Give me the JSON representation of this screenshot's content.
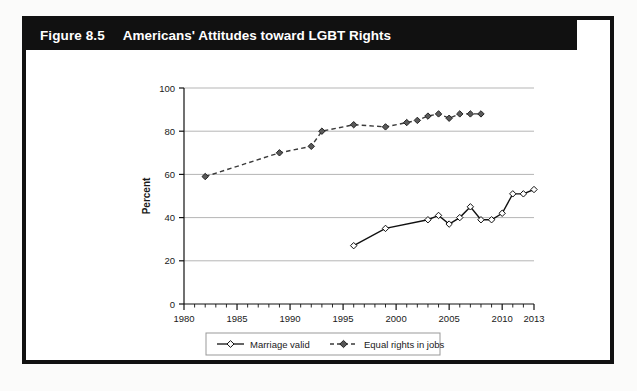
{
  "figure": {
    "number": "Figure 8.5",
    "title": "Americans' Attitudes toward LGBT Rights"
  },
  "chart_data": {
    "type": "line",
    "title": "Americans' Attitudes toward LGBT Rights",
    "xlabel": "Year",
    "ylabel": "Percent",
    "xlim": [
      1980,
      2013
    ],
    "ylim": [
      0,
      100
    ],
    "ytick_labels": [
      "0",
      "20",
      "40",
      "60",
      "80",
      "100"
    ],
    "yticks": [
      0,
      20,
      40,
      60,
      80,
      100
    ],
    "xtick_labels": [
      "1980",
      "1985",
      "1990",
      "1995",
      "2000",
      "2005",
      "2010",
      "2013"
    ],
    "xticks": [
      1980,
      1985,
      1990,
      1995,
      2000,
      2005,
      2010,
      2013
    ],
    "minor_xtick_step": 1,
    "grid": "horizontal",
    "legend_position": "bottom-center",
    "series": [
      {
        "name": "Marriage valid",
        "style": "solid",
        "marker": "open-diamond",
        "color": "#111111",
        "x": [
          1996,
          1999,
          2003,
          2004,
          2005,
          2006,
          2007,
          2008,
          2009,
          2010,
          2011,
          2012,
          2013
        ],
        "values": [
          27,
          35,
          39,
          41,
          37,
          40,
          45,
          39,
          39,
          42,
          51,
          51,
          53
        ]
      },
      {
        "name": "Equal rights in jobs",
        "style": "dashed",
        "marker": "filled-diamond",
        "color": "#3a3a3a",
        "x": [
          1982,
          1989,
          1992,
          1993,
          1996,
          1999,
          2001,
          2002,
          2003,
          2004,
          2005,
          2006,
          2007,
          2008
        ],
        "values": [
          59,
          70,
          73,
          80,
          83,
          82,
          84,
          85,
          87,
          88,
          86,
          88,
          88,
          88
        ]
      }
    ]
  },
  "legend": {
    "entries": [
      {
        "label": "Marriage valid"
      },
      {
        "label": "Equal rights in jobs"
      }
    ]
  }
}
